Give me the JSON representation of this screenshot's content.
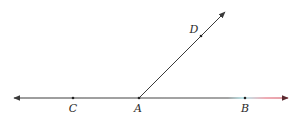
{
  "diagram": {
    "type": "geometry-angle",
    "colors": {
      "line": "#3a3a3a",
      "line_right_cyan": "#7fd3dc",
      "line_right_red": "#e0586a",
      "label": "#2a2a2a"
    },
    "line": {
      "name": "line CB",
      "start": [
        14,
        98
      ],
      "end": [
        288,
        98
      ],
      "arrows": "both"
    },
    "ray": {
      "name": "ray AD",
      "start": [
        139,
        98
      ],
      "end": [
        225,
        12
      ],
      "arrows": "end"
    },
    "points": [
      {
        "name": "C",
        "label": "C",
        "x": 73,
        "y": 98,
        "label_x": 73,
        "label_y": 112
      },
      {
        "name": "A",
        "label": "A",
        "x": 139,
        "y": 98,
        "label_x": 138,
        "label_y": 112
      },
      {
        "name": "B",
        "label": "B",
        "x": 245,
        "y": 98,
        "label_x": 245,
        "label_y": 112
      },
      {
        "name": "D",
        "label": "D",
        "x": 201,
        "y": 36,
        "label_x": 194,
        "label_y": 33
      }
    ]
  }
}
